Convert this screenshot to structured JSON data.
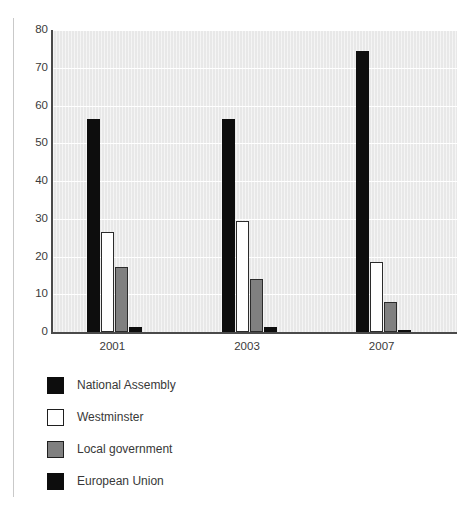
{
  "chart_data": {
    "type": "bar",
    "title": "",
    "subtitle": "",
    "xlabel": "",
    "ylabel": "",
    "categories": [
      "2001",
      "2003",
      "2007"
    ],
    "series": [
      {
        "name": "National Assembly",
        "color": "#0d0d0d",
        "style": "black",
        "values": [
          56.5,
          56.5,
          74.5
        ]
      },
      {
        "name": "Westminster",
        "color": "#ffffff",
        "style": "white",
        "values": [
          26.5,
          29.5,
          18.5
        ]
      },
      {
        "name": "Local government",
        "color": "#808080",
        "style": "gray",
        "values": [
          17.3,
          14.0,
          8.0
        ]
      },
      {
        "name": "European Union",
        "color": "#0d0d0d",
        "style": "black",
        "values": [
          1.3,
          1.3,
          0.6
        ]
      }
    ],
    "ylim": [
      0,
      80
    ],
    "yticks": [
      0,
      10,
      20,
      30,
      40,
      50,
      60,
      70,
      80
    ],
    "ytick_labels": [
      "0",
      "10",
      "20",
      "30",
      "40",
      "50",
      "60",
      "70",
      "80"
    ],
    "grid": true,
    "grid_axis": "y",
    "legend_position": "below",
    "plot_background": "#e8e8e8",
    "gridline_color": "#ffffff",
    "axis_color": "#4a4a4a"
  },
  "legend": {
    "entries": [
      {
        "label": "National Assembly"
      },
      {
        "label": "Westminster"
      },
      {
        "label": "Local government"
      },
      {
        "label": "European Union"
      }
    ]
  }
}
